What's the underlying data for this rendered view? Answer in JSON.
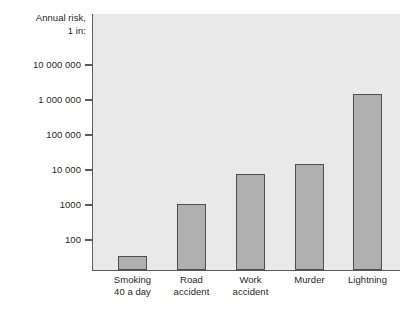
{
  "chart_data": {
    "type": "bar",
    "title": "",
    "subtitle": "",
    "ylabel": "Annual risk, 1 in:",
    "ylabel_line1": "Annual risk,",
    "ylabel_line2": "1 in:",
    "xlabel": "",
    "scale": "log",
    "grid": false,
    "legend": "none",
    "ylim": [
      100,
      30000000
    ],
    "ytick_labels": [
      "10 000 000",
      "1 000 000",
      "100 000",
      "10 000",
      "1000",
      "100"
    ],
    "ytick_values": [
      10000000,
      1000000,
      100000,
      10000,
      1000,
      100
    ],
    "categories": [
      "Smoking 40 a day",
      "Road accident",
      "Work accident",
      "Murder",
      "Lightning"
    ],
    "category_lines": [
      [
        "Smoking",
        "40 a day"
      ],
      [
        "Road",
        "accident"
      ],
      [
        "Work",
        "accident"
      ],
      [
        "Murder",
        ""
      ],
      [
        "Lightning",
        ""
      ]
    ],
    "values": [
      250,
      7500,
      55000,
      105000,
      11000000
    ],
    "colors": {
      "bar_fill": "#b0b0b0",
      "bar_stroke": "#4f4f4f",
      "plot_background": "#e9e9e9",
      "axis": "#5a5a5a",
      "text": "#1f1f1f",
      "page_background": "#ffffff"
    }
  },
  "geometry": {
    "plot_left": 92,
    "plot_right": 400,
    "plot_top": 14,
    "baseline": 270,
    "decade_px": 35,
    "bar_width": 29,
    "bar_lefts": [
      118,
      177,
      236,
      295,
      353
    ],
    "ytick_y": [
      65,
      100,
      135,
      170,
      205,
      240
    ],
    "bar_tops": [
      222,
      170,
      144,
      133,
      61
    ]
  }
}
